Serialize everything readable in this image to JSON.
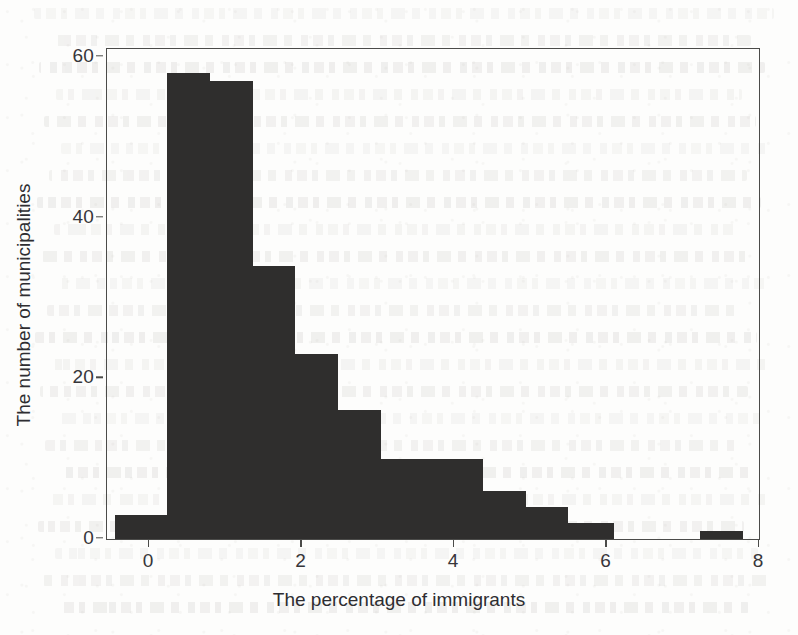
{
  "chart_data": {
    "type": "bar",
    "title": "",
    "subtitle": "",
    "xlabel": "The percentage of immigrants",
    "ylabel": "The number of municipalities",
    "xlim": [
      -0.55,
      8.0
    ],
    "ylim": [
      0,
      61
    ],
    "grid": false,
    "legend": null,
    "bar_color": "#2f2e2d",
    "axis_color": "#4b4b49",
    "bin_width": 0.56,
    "xticks": [
      0,
      2,
      4,
      6,
      8
    ],
    "xtick_labels": [
      "0",
      "2",
      "4",
      "6",
      "8"
    ],
    "yticks": [
      0,
      20,
      40,
      60
    ],
    "ytick_labels": [
      "0",
      "20",
      "40",
      "60"
    ],
    "bins": [
      {
        "x0": -0.44,
        "x1": 0.24,
        "count": 3
      },
      {
        "x0": 0.24,
        "x1": 0.8,
        "count": 58
      },
      {
        "x0": 0.8,
        "x1": 1.36,
        "count": 57
      },
      {
        "x0": 1.36,
        "x1": 1.92,
        "count": 34
      },
      {
        "x0": 1.92,
        "x1": 2.48,
        "count": 23
      },
      {
        "x0": 2.48,
        "x1": 3.04,
        "count": 16
      },
      {
        "x0": 3.04,
        "x1": 3.6,
        "count": 10
      },
      {
        "x0": 3.6,
        "x1": 4.38,
        "count": 10
      },
      {
        "x0": 4.38,
        "x1": 4.94,
        "count": 6
      },
      {
        "x0": 4.94,
        "x1": 5.5,
        "count": 4
      },
      {
        "x0": 5.5,
        "x1": 6.1,
        "count": 2
      },
      {
        "x0": 7.23,
        "x1": 7.79,
        "count": 1
      }
    ],
    "categories": [
      "-0.4",
      "0.5",
      "1.1",
      "1.6",
      "2.2",
      "2.8",
      "3.3",
      "4.0",
      "4.7",
      "5.2",
      "5.8",
      "7.5"
    ],
    "values": [
      3,
      58,
      57,
      34,
      23,
      16,
      10,
      10,
      6,
      4,
      2,
      1
    ]
  },
  "page": {
    "background_note": "scanned book page with faint show-through text behind the figure"
  }
}
